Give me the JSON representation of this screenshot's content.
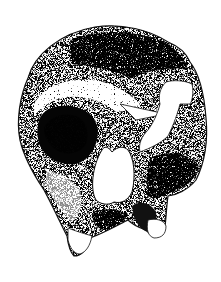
{
  "figure": {
    "style": "black-and-white stipple / pointillist drawing",
    "colors": {
      "background": "#ffffff",
      "ink": "#000000",
      "mid_tone": "#5a5a5a",
      "light_tone": "#d8d8d8"
    },
    "regions": [
      {
        "name": "braincase-vault",
        "tone": "mid-stipple"
      },
      {
        "name": "brow-ridge",
        "tone": "light-stipple"
      },
      {
        "name": "left-orbit",
        "tone": "dark"
      },
      {
        "name": "right-orbit-broken-opening",
        "tone": "white-gap"
      },
      {
        "name": "nasal-aperture",
        "tone": "white-gap"
      },
      {
        "name": "maxilla-and-teeth",
        "tone": "mixed-stipple"
      },
      {
        "name": "zygomatic-right",
        "tone": "dark-stipple"
      }
    ]
  }
}
